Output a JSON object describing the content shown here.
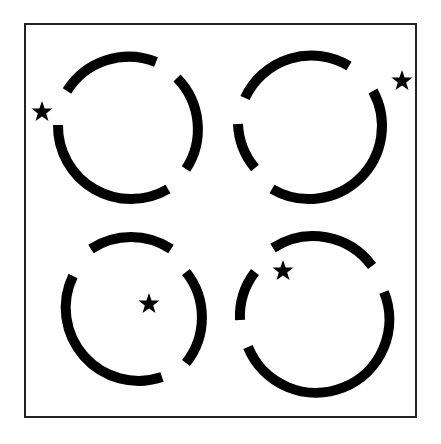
{
  "figure": {
    "background": "#ffffff",
    "ink": "#000000",
    "frame": {
      "x": 25,
      "y": 24,
      "w": 391,
      "h": 393
    },
    "panels": [
      {
        "name": "top-left",
        "cx": 130,
        "cy": 130,
        "r": 73,
        "star": {
          "x": 42,
          "y": 111
        }
      },
      {
        "name": "top-right",
        "cx": 311,
        "cy": 130,
        "r": 73,
        "star": {
          "x": 402,
          "y": 80
        }
      },
      {
        "name": "bottom-left",
        "cx": 131,
        "cy": 310,
        "r": 73,
        "star": {
          "x": 149,
          "y": 303
        }
      },
      {
        "name": "bottom-right",
        "cx": 311,
        "cy": 310,
        "r": 73,
        "star": {
          "x": 283,
          "y": 270
        }
      }
    ]
  }
}
